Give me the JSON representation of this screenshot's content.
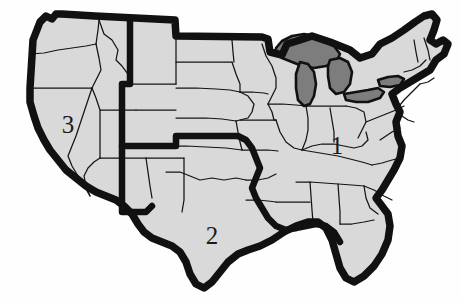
{
  "figure": {
    "width": 460,
    "height": 301,
    "background_color": "#fefefe"
  },
  "colors": {
    "land_fill": "#d9d9d9",
    "state_border": "#141414",
    "national_outline": "#111111",
    "region_divider": "#111111",
    "lake_fill": "#7d7d7d",
    "label_color": "#1a1a1a"
  },
  "map": {
    "name": "contiguous-united-states",
    "water_features": [
      {
        "name": "great-lakes",
        "label": "Great Lakes",
        "fill": "#7d7d7d"
      }
    ],
    "region_labels": [
      {
        "id": "region-1",
        "text": "1",
        "x": 337,
        "y": 148
      },
      {
        "id": "region-2",
        "text": "2",
        "x": 212,
        "y": 238
      },
      {
        "id": "region-3",
        "text": "3",
        "x": 68,
        "y": 127
      }
    ]
  }
}
